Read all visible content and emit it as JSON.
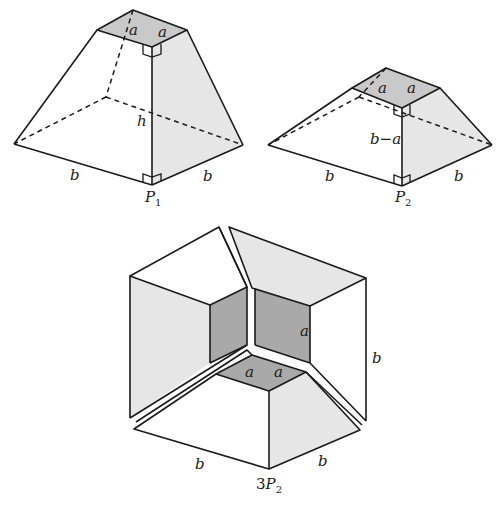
{
  "figure": {
    "colors": {
      "line": "#1a1a1a",
      "light_face": "#e6e6e6",
      "mid_face": "#c9c9c9",
      "dark_face": "#a9a9a9",
      "background": "#ffffff"
    },
    "frustum1": {
      "name": "P",
      "subscript": "1",
      "top_edge_labels": [
        "a",
        "a"
      ],
      "height_label": "h",
      "base_edge_labels": [
        "b",
        "b"
      ]
    },
    "frustum2": {
      "name": "P",
      "subscript": "2",
      "top_edge_labels": [
        "a",
        "a"
      ],
      "height_label": "b−a",
      "base_edge_labels": [
        "b",
        "b"
      ]
    },
    "assembly": {
      "prefix": "3",
      "name": "P",
      "subscript": "2",
      "inner_cube_labels": [
        "a",
        "a",
        "a"
      ],
      "height_label": "b",
      "base_edge_labels": [
        "b",
        "b"
      ]
    }
  }
}
